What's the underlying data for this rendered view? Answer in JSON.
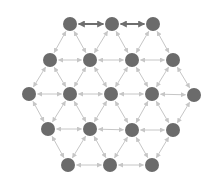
{
  "diagram": {
    "type": "hexagonal-lattice-graph",
    "width": 216,
    "height": 185,
    "colors": {
      "background": "#ffffff",
      "node": "#6b6b6b",
      "edge_light": "#c6c6c6",
      "edge_dark": "#6e6e6e"
    },
    "node_radius": 7,
    "nodes": [
      {
        "id": "r1c1",
        "x": 70,
        "y": 24
      },
      {
        "id": "r1c2",
        "x": 112,
        "y": 24
      },
      {
        "id": "r1c3",
        "x": 153,
        "y": 24
      },
      {
        "id": "r2c1",
        "x": 50,
        "y": 60
      },
      {
        "id": "r2c2",
        "x": 90,
        "y": 60
      },
      {
        "id": "r2c3",
        "x": 132,
        "y": 60
      },
      {
        "id": "r2c4",
        "x": 173,
        "y": 60
      },
      {
        "id": "r3c1",
        "x": 29,
        "y": 94
      },
      {
        "id": "r3c2",
        "x": 70,
        "y": 94
      },
      {
        "id": "r3c3",
        "x": 111,
        "y": 94
      },
      {
        "id": "r3c4",
        "x": 152,
        "y": 94
      },
      {
        "id": "r3c5",
        "x": 194,
        "y": 95
      },
      {
        "id": "r4c1",
        "x": 48,
        "y": 129
      },
      {
        "id": "r4c2",
        "x": 90,
        "y": 129
      },
      {
        "id": "r4c3",
        "x": 132,
        "y": 130
      },
      {
        "id": "r4c4",
        "x": 173,
        "y": 130
      },
      {
        "id": "r5c1",
        "x": 68,
        "y": 165
      },
      {
        "id": "r5c2",
        "x": 110,
        "y": 165
      },
      {
        "id": "r5c3",
        "x": 152,
        "y": 165
      }
    ],
    "edges": [
      {
        "from": "r1c1",
        "to": "r1c2",
        "style": "dark"
      },
      {
        "from": "r1c2",
        "to": "r1c3",
        "style": "dark"
      },
      {
        "from": "r2c1",
        "to": "r2c2",
        "style": "light"
      },
      {
        "from": "r2c2",
        "to": "r2c3",
        "style": "light"
      },
      {
        "from": "r2c3",
        "to": "r2c4",
        "style": "light"
      },
      {
        "from": "r3c1",
        "to": "r3c2",
        "style": "light"
      },
      {
        "from": "r3c2",
        "to": "r3c3",
        "style": "light"
      },
      {
        "from": "r3c3",
        "to": "r3c4",
        "style": "light"
      },
      {
        "from": "r3c4",
        "to": "r3c5",
        "style": "light"
      },
      {
        "from": "r4c1",
        "to": "r4c2",
        "style": "light"
      },
      {
        "from": "r4c2",
        "to": "r4c3",
        "style": "light"
      },
      {
        "from": "r4c3",
        "to": "r4c4",
        "style": "light"
      },
      {
        "from": "r5c1",
        "to": "r5c2",
        "style": "light"
      },
      {
        "from": "r5c2",
        "to": "r5c3",
        "style": "light"
      },
      {
        "from": "r1c1",
        "to": "r2c1",
        "style": "light"
      },
      {
        "from": "r1c1",
        "to": "r2c2",
        "style": "light"
      },
      {
        "from": "r1c2",
        "to": "r2c2",
        "style": "light"
      },
      {
        "from": "r1c2",
        "to": "r2c3",
        "style": "light"
      },
      {
        "from": "r1c3",
        "to": "r2c3",
        "style": "light"
      },
      {
        "from": "r1c3",
        "to": "r2c4",
        "style": "light"
      },
      {
        "from": "r2c1",
        "to": "r3c1",
        "style": "light"
      },
      {
        "from": "r2c1",
        "to": "r3c2",
        "style": "light"
      },
      {
        "from": "r2c2",
        "to": "r3c2",
        "style": "light"
      },
      {
        "from": "r2c2",
        "to": "r3c3",
        "style": "light"
      },
      {
        "from": "r2c3",
        "to": "r3c3",
        "style": "light"
      },
      {
        "from": "r2c3",
        "to": "r3c4",
        "style": "light"
      },
      {
        "from": "r2c4",
        "to": "r3c4",
        "style": "light"
      },
      {
        "from": "r2c4",
        "to": "r3c5",
        "style": "light"
      },
      {
        "from": "r3c1",
        "to": "r4c1",
        "style": "light"
      },
      {
        "from": "r3c2",
        "to": "r4c1",
        "style": "light"
      },
      {
        "from": "r3c2",
        "to": "r4c2",
        "style": "light"
      },
      {
        "from": "r3c3",
        "to": "r4c2",
        "style": "light"
      },
      {
        "from": "r3c3",
        "to": "r4c3",
        "style": "light"
      },
      {
        "from": "r3c4",
        "to": "r4c3",
        "style": "light"
      },
      {
        "from": "r3c4",
        "to": "r4c4",
        "style": "light"
      },
      {
        "from": "r3c5",
        "to": "r4c4",
        "style": "light"
      },
      {
        "from": "r4c1",
        "to": "r5c1",
        "style": "light"
      },
      {
        "from": "r4c2",
        "to": "r5c1",
        "style": "light"
      },
      {
        "from": "r4c2",
        "to": "r5c2",
        "style": "light"
      },
      {
        "from": "r4c3",
        "to": "r5c2",
        "style": "light"
      },
      {
        "from": "r4c3",
        "to": "r5c3",
        "style": "light"
      },
      {
        "from": "r4c4",
        "to": "r5c3",
        "style": "light"
      }
    ]
  }
}
